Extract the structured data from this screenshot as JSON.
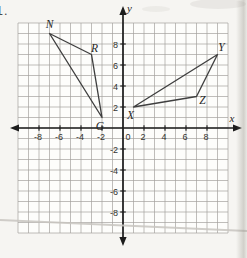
{
  "problem_number": "1.",
  "chart_data": {
    "type": "scatter",
    "title": "",
    "xlabel": "x",
    "ylabel": "y",
    "xlim": [
      -10,
      10
    ],
    "ylim": [
      -10,
      10
    ],
    "grid": true,
    "legend": false,
    "x_tick_labels": [
      -8,
      -6,
      -4,
      -2,
      0,
      2,
      4,
      6,
      8
    ],
    "y_tick_labels": [
      -8,
      -6,
      -4,
      -2,
      2,
      4,
      6,
      8
    ],
    "polygons": [
      {
        "name": "triangle-NRG",
        "vertices": [
          {
            "label": "N",
            "x": -7,
            "y": 9,
            "label_dx": 0,
            "label_dy": -9
          },
          {
            "label": "R",
            "x": -3,
            "y": 7,
            "label_dx": 3,
            "label_dy": -6
          },
          {
            "label": "G",
            "x": -2,
            "y": 1,
            "label_dx": -2,
            "label_dy": 9
          }
        ]
      },
      {
        "name": "triangle-XYZ",
        "vertices": [
          {
            "label": "X",
            "x": 1,
            "y": 2,
            "label_dx": -3,
            "label_dy": 8
          },
          {
            "label": "Y",
            "x": 9,
            "y": 7,
            "label_dx": 4,
            "label_dy": -7
          },
          {
            "label": "Z",
            "x": 7,
            "y": 3,
            "label_dx": 6,
            "label_dy": 4
          }
        ]
      }
    ],
    "colors": {
      "axis": "#1c1c1c",
      "grid_line": "#a3a19d",
      "plot_bg": "#fdfdfb",
      "shape_stroke": "#3f3f3f",
      "tick_label": "#333330",
      "vertex_label": "#262626",
      "artifact": "#c9c6c1"
    }
  }
}
